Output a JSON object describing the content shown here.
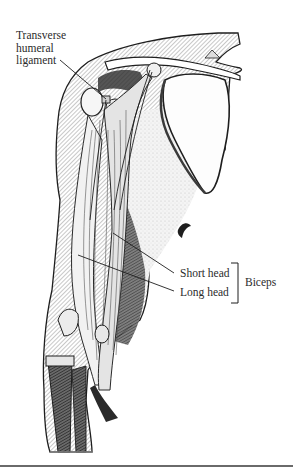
{
  "figure": {
    "labels": {
      "transverse_humeral_ligament": [
        "Transverse",
        "humeral",
        "ligament"
      ],
      "short_head": "Short head",
      "long_head": "Long head",
      "biceps": "Biceps"
    },
    "colors": {
      "ink": "#1e1e1e",
      "hatch_mid": "#8a8a8a",
      "hatch_light": "#c9c9c9",
      "paper": "#ffffff",
      "rule": "#6a6a6a"
    }
  }
}
